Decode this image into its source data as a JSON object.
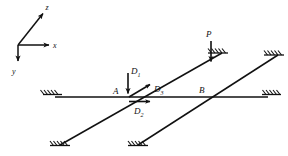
{
  "figure": {
    "type": "structural-mechanics-diagram",
    "stroke_color": "#111111",
    "background_color": "#ffffff"
  },
  "axes": {
    "origin": {
      "x": 18,
      "y": 45
    },
    "labels": {
      "z": "z",
      "x": "x",
      "y": "y"
    },
    "z_tip": {
      "x": 44,
      "y": 12
    },
    "x_tip": {
      "x": 52,
      "y": 45
    },
    "y_tip": {
      "x": 18,
      "y": 64
    }
  },
  "points": {
    "a": {
      "label": "A",
      "x": 126,
      "y": 97
    },
    "b": {
      "label": "B",
      "x": 206,
      "y": 97
    }
  },
  "loads": {
    "p": {
      "label": "P",
      "tail": {
        "x": 211,
        "y": 40
      },
      "tip": {
        "x": 211,
        "y": 64
      },
      "label_pos": {
        "x": 207,
        "y": 36
      }
    },
    "d1": {
      "label": "D",
      "subscript": "1",
      "tail": {
        "x": 128,
        "y": 72
      },
      "tip": {
        "x": 128,
        "y": 95
      },
      "label_pos": {
        "x": 131,
        "y": 72
      }
    },
    "d2": {
      "label": "D",
      "subscript": "2",
      "tail": {
        "x": 129,
        "y": 101
      },
      "tip": {
        "x": 152,
        "y": 101
      },
      "label_pos": {
        "x": 137,
        "y": 113
      }
    },
    "d3": {
      "label": "D",
      "subscript": "3",
      "tail": {
        "x": 129,
        "y": 97
      },
      "tip": {
        "x": 152,
        "y": 83
      },
      "label_pos": {
        "x": 155,
        "y": 91
      }
    }
  },
  "members": {
    "horizontal": {
      "x1": 55,
      "y1": 97,
      "x2": 268,
      "y2": 97
    },
    "diagonal_upper": {
      "x1": 60,
      "y1": 145,
      "x2": 222,
      "y2": 53
    },
    "diagonal_lower": {
      "x1": 138,
      "y1": 145,
      "x2": 278,
      "y2": 55
    }
  },
  "supports": [
    {
      "name": "support-horizontal-left",
      "x": 58,
      "y": 96,
      "rotation": 0
    },
    {
      "name": "support-horizontal-right",
      "x": 263,
      "y": 96,
      "rotation": 0
    },
    {
      "name": "support-diag-upper-bottom",
      "x": 64,
      "y": 143,
      "rotation": 0
    },
    {
      "name": "support-diag-upper-top",
      "x": 218,
      "y": 55,
      "rotation": 0
    },
    {
      "name": "support-diag-lower-bottom",
      "x": 142,
      "y": 143,
      "rotation": 0
    },
    {
      "name": "support-diag-lower-top",
      "x": 274,
      "y": 57,
      "rotation": 0
    }
  ]
}
